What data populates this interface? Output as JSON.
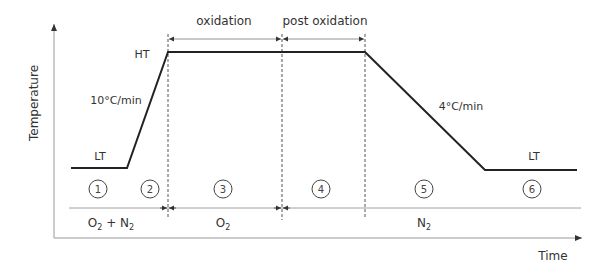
{
  "axes": {
    "y_label": "Temperature",
    "x_label": "Time"
  },
  "levels": {
    "high": "HT",
    "low_start": "LT",
    "low_end": "LT"
  },
  "rates": {
    "heating": "10°C/min",
    "cooling": "4°C/min"
  },
  "phases": [
    {
      "label": "oxidation"
    },
    {
      "label": "post oxidation"
    }
  ],
  "steps": [
    "1",
    "2",
    "3",
    "4",
    "5",
    "6"
  ],
  "atmospheres": [
    {
      "main": "O",
      "sub": "2",
      "suffix": " + N",
      "suffix_sub": "2"
    },
    {
      "main": "O",
      "sub": "2",
      "suffix": "",
      "suffix_sub": ""
    },
    {
      "main": "N",
      "sub": "2",
      "suffix": "",
      "suffix_sub": ""
    }
  ],
  "colors": {
    "profile": "#222222",
    "axis": "#888888",
    "guide": "#555555",
    "text": "#333333"
  }
}
